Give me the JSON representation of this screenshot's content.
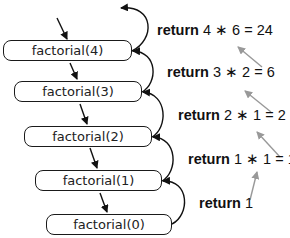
{
  "diagram": {
    "type": "recursion-call-stack",
    "calls": [
      {
        "label": "factorial(4)"
      },
      {
        "label": "factorial(3)"
      },
      {
        "label": "factorial(2)"
      },
      {
        "label": "factorial(1)"
      },
      {
        "label": "factorial(0)"
      }
    ],
    "returns": [
      {
        "keyword": "return",
        "expr": "4 ∗ 6 = 24"
      },
      {
        "keyword": "return",
        "expr": "3 ∗ 2 = 6"
      },
      {
        "keyword": "return",
        "expr": "2 ∗ 1 = 2"
      },
      {
        "keyword": "return",
        "expr": "1 ∗ 1 = 1"
      },
      {
        "keyword": "return",
        "expr": "1"
      }
    ],
    "colors": {
      "call_arrow": "#111111",
      "value_arrow": "#999999",
      "box_border": "#1a1a1a"
    }
  }
}
